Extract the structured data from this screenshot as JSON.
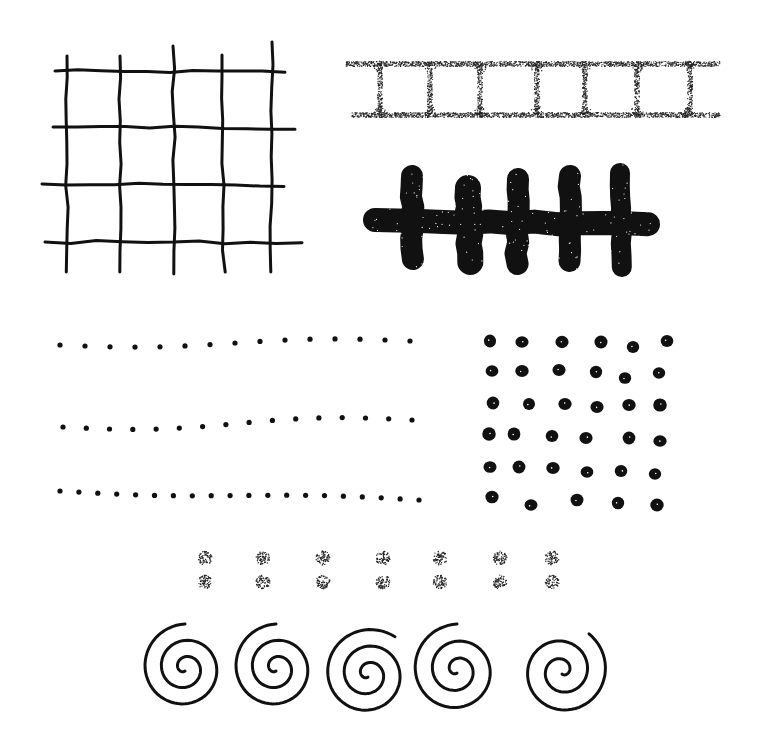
{
  "illustration": {
    "background": "#ffffff",
    "ink": "#111111",
    "motifs": [
      "hand-drawn grid",
      "stippled ladder",
      "bold cross-hatch bar",
      "three rows of small dots",
      "grid of large dots",
      "paired stippled dots",
      "row of spirals"
    ]
  },
  "grid": {
    "vertical_x": [
      67,
      120,
      173,
      222,
      272
    ],
    "vertical_top": [
      56,
      56,
      46,
      55,
      42
    ],
    "vertical_bottom": [
      272,
      272,
      274,
      272,
      272
    ],
    "horizontal_y": [
      71,
      127,
      184,
      242
    ],
    "horizontal_left": [
      55,
      53,
      42,
      45
    ],
    "horizontal_right": [
      285,
      295,
      284,
      302
    ],
    "stroke_width": 3
  },
  "ladder": {
    "top_y": 64,
    "bottom_y": 115,
    "x_start": 346,
    "x_end": 720,
    "rung_x": [
      380,
      430,
      480,
      537,
      585,
      637,
      690
    ]
  },
  "hatch_bar": {
    "bar": {
      "x1": 375,
      "y1": 220,
      "x2": 648,
      "y2": 224,
      "thickness": 24
    },
    "posts": [
      {
        "x": 412,
        "top": 165,
        "bottom": 270,
        "width": 22
      },
      {
        "x": 468,
        "top": 175,
        "bottom": 275,
        "width": 26
      },
      {
        "x": 518,
        "top": 168,
        "bottom": 275,
        "width": 22
      },
      {
        "x": 570,
        "top": 165,
        "bottom": 272,
        "width": 22
      },
      {
        "x": 620,
        "top": 163,
        "bottom": 277,
        "width": 20
      }
    ]
  },
  "small_dot_rows": [
    {
      "y_start": 345,
      "y_end": 341,
      "x_start": 60,
      "x_end": 410,
      "count": 15,
      "wave": 3
    },
    {
      "y_start": 427,
      "y_end": 420,
      "x_start": 63,
      "x_end": 412,
      "count": 16,
      "wave": 4
    },
    {
      "y_start": 491,
      "y_end": 500,
      "x_start": 60,
      "x_end": 419,
      "count": 20,
      "wave": 2
    }
  ],
  "large_dots": {
    "rows": [
      [
        [
          490,
          341
        ],
        [
          522,
          342
        ],
        [
          562,
          342
        ],
        [
          601,
          342
        ],
        [
          633,
          347
        ],
        [
          667,
          341
        ]
      ],
      [
        [
          492,
          371
        ],
        [
          522,
          371
        ],
        [
          559,
          370
        ],
        [
          596,
          372
        ],
        [
          625,
          378
        ],
        [
          659,
          373
        ]
      ],
      [
        [
          493,
          403
        ],
        [
          529,
          404
        ],
        [
          565,
          404
        ],
        [
          597,
          407
        ],
        [
          629,
          405
        ],
        [
          660,
          405
        ]
      ],
      [
        [
          489,
          434
        ],
        [
          514,
          434
        ],
        [
          552,
          436
        ],
        [
          586,
          438
        ],
        [
          629,
          438
        ],
        [
          660,
          441
        ]
      ],
      [
        [
          490,
          467
        ],
        [
          519,
          467
        ],
        [
          553,
          468
        ],
        [
          587,
          472
        ],
        [
          621,
          471
        ],
        [
          655,
          474
        ]
      ],
      [
        [
          492,
          497
        ],
        [
          531,
          505
        ],
        [
          577,
          500
        ],
        [
          618,
          503
        ],
        [
          657,
          505
        ]
      ]
    ],
    "radius": 6
  },
  "paired_dots": {
    "x": [
      205,
      263,
      323,
      383,
      440,
      500,
      552
    ],
    "y_top": 558,
    "y_bottom": 582,
    "radius": 7
  },
  "spirals": [
    {
      "cx": 185,
      "cy": 668,
      "turns": 2.5,
      "r": 44,
      "dir": 1
    },
    {
      "cx": 276,
      "cy": 668,
      "turns": 2.5,
      "r": 44,
      "dir": 1
    },
    {
      "cx": 368,
      "cy": 674,
      "turns": 2.6,
      "r": 46,
      "dir": 1
    },
    {
      "cx": 457,
      "cy": 670,
      "turns": 2.5,
      "r": 46,
      "dir": 1
    },
    {
      "cx": 562,
      "cy": 671,
      "turns": 2.4,
      "r": 46,
      "dir": -1
    }
  ]
}
